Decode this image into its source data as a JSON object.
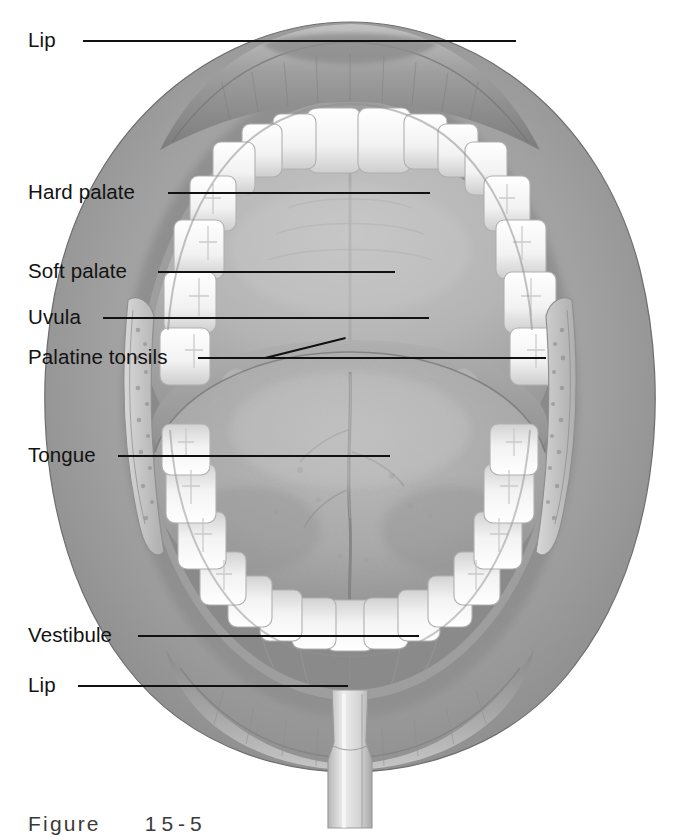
{
  "figure": {
    "caption_word": "Figure",
    "caption_number": "15-5",
    "background_color": "#ffffff",
    "line_color": "#111111",
    "text_color": "#121212",
    "style": "grayscale medical illustration"
  },
  "palette": {
    "lip_outer": "#9b9b9b",
    "lip_inner": "#8e8e8e",
    "mucosa": "#a5a5a5",
    "hard_palate": "#b9b9b9",
    "soft_palate": "#9a9a9a",
    "oropharynx": "#5d5d5d",
    "tongue": "#a8a8a8",
    "tooth": "#f4f4f4",
    "tooth_shadow": "#cfcfcf",
    "cheek_retractor": "#c9c9c9",
    "tonsil": "#b0b0b0"
  },
  "labels": [
    {
      "id": "lip-upper",
      "text": "Lip",
      "x": 28,
      "y": 30,
      "line_x": 83,
      "line_y": 40,
      "line_len": 433
    },
    {
      "id": "hard-palate",
      "text": "Hard palate",
      "x": 28,
      "y": 182,
      "line_x": 168,
      "line_y": 192,
      "line_len": 262
    },
    {
      "id": "soft-palate",
      "text": "Soft palate",
      "x": 28,
      "y": 261,
      "line_x": 158,
      "line_y": 271,
      "line_len": 237
    },
    {
      "id": "uvula",
      "text": "Uvula",
      "x": 28,
      "y": 307,
      "line_x": 103,
      "line_y": 317,
      "line_len": 326
    },
    {
      "id": "palatine-tonsils",
      "text": "Palatine tonsils",
      "x": 28,
      "y": 347,
      "line_x": 198,
      "line_y": 357,
      "line_len": 348
    },
    {
      "id": "tongue",
      "text": "Tongue",
      "x": 28,
      "y": 445,
      "line_x": 118,
      "line_y": 455,
      "line_len": 272
    },
    {
      "id": "vestibule",
      "text": "Vestibule",
      "x": 28,
      "y": 625,
      "line_x": 138,
      "line_y": 635,
      "line_len": 281
    },
    {
      "id": "lip-lower",
      "text": "Lip",
      "x": 28,
      "y": 675,
      "line_x": 78,
      "line_y": 685,
      "line_len": 270
    }
  ],
  "tonsil_branch": {
    "from_x": 265,
    "from_y": 357,
    "to_x": 345,
    "to_y": 337
  },
  "structures": [
    "upper lip",
    "lower lip",
    "upper dental arch",
    "lower dental arch",
    "hard palate with median raphe",
    "soft palate",
    "uvula",
    "palatoglossal arch",
    "palatine tonsil left",
    "palatine tonsil right",
    "oropharynx",
    "tongue dorsum with median sulcus",
    "vestibule",
    "cheek retractor left",
    "cheek retractor right",
    "tongue depressor"
  ]
}
